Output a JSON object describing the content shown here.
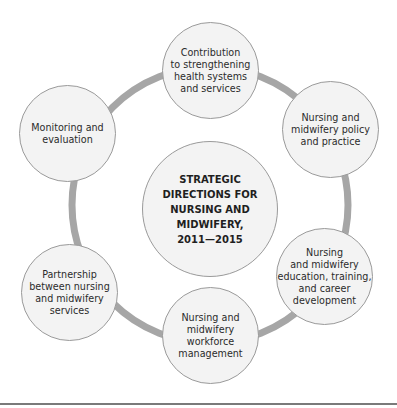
{
  "diagram": {
    "title": "STRATEGIC\nDIRECTIONS FOR\nNURSING AND\nMIDWIFERY,\n2011—2015",
    "ring_color": "#a6a6a6",
    "node_fill": "#f3f3f3",
    "node_border": "#9a9a9a",
    "nodes": [
      {
        "label": "Contribution\nto strengthening\nhealth systems\nand services"
      },
      {
        "label": "Nursing and\nmidwifery policy\nand practice"
      },
      {
        "label": "Nursing\nand midwifery\neducation, training,\nand career\ndevelopment"
      },
      {
        "label": "Nursing and\nmidwifery\nworkforce\nmanagement"
      },
      {
        "label": "Partnership\nbetween nursing\nand midwifery\nservices"
      },
      {
        "label": "Monitoring and\nevaluation"
      }
    ]
  }
}
